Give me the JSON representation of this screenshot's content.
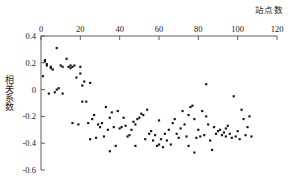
{
  "chart_data": {
    "type": "scatter",
    "title": "",
    "xlabel": "站点数",
    "ylabel": "相关系数",
    "xlim": [
      0,
      120
    ],
    "ylim": [
      -0.6,
      0.4
    ],
    "x_axis_position": "top",
    "y_axis_position": "left",
    "grid": false,
    "legend": null,
    "marker": "square",
    "marker_color": "#1a1a1a",
    "marker_size_px": 2.2,
    "xticks": [
      0,
      20,
      40,
      60,
      80,
      100,
      120
    ],
    "xticklabels": [
      "0",
      "20",
      "40",
      "60",
      "80",
      "100",
      "120"
    ],
    "yticks": [
      0.4,
      0.2,
      0,
      -0.2,
      -0.4,
      -0.6
    ],
    "yticklabels": [
      "0.4",
      "0.2",
      "0",
      "-0.2",
      "-0.4",
      "-0.6"
    ],
    "series": [
      {
        "name": "correlation",
        "points": [
          [
            1,
            0.1
          ],
          [
            2,
            0.22
          ],
          [
            2,
            0.21
          ],
          [
            3,
            0.19
          ],
          [
            3,
            0.18
          ],
          [
            4,
            -0.03
          ],
          [
            5,
            0.17
          ],
          [
            5,
            0.16
          ],
          [
            6,
            0.15
          ],
          [
            7,
            -0.02
          ],
          [
            8,
            0.31
          ],
          [
            8,
            0.0
          ],
          [
            9,
            0.01
          ],
          [
            10,
            0.18
          ],
          [
            11,
            0.17
          ],
          [
            11,
            -0.03
          ],
          [
            13,
            0.23
          ],
          [
            14,
            0.17
          ],
          [
            15,
            0.18
          ],
          [
            15,
            0.16
          ],
          [
            16,
            0.17
          ],
          [
            16,
            -0.25
          ],
          [
            17,
            0.18
          ],
          [
            18,
            0.09
          ],
          [
            19,
            -0.26
          ],
          [
            20,
            0.17
          ],
          [
            20,
            0.12
          ],
          [
            21,
            0.03
          ],
          [
            21,
            -0.09
          ],
          [
            22,
            0.06
          ],
          [
            23,
            -0.09
          ],
          [
            24,
            -0.25
          ],
          [
            25,
            0.05
          ],
          [
            25,
            -0.37
          ],
          [
            26,
            -0.22
          ],
          [
            27,
            -0.19
          ],
          [
            28,
            -0.36
          ],
          [
            29,
            -0.26
          ],
          [
            30,
            -0.28
          ],
          [
            31,
            -0.25
          ],
          [
            32,
            -0.35
          ],
          [
            33,
            -0.13
          ],
          [
            34,
            -0.3
          ],
          [
            35,
            -0.21
          ],
          [
            35,
            -0.46
          ],
          [
            36,
            -0.17
          ],
          [
            37,
            -0.28
          ],
          [
            38,
            -0.42
          ],
          [
            39,
            -0.16
          ],
          [
            40,
            -0.29
          ],
          [
            41,
            -0.28
          ],
          [
            42,
            -0.21
          ],
          [
            43,
            -0.27
          ],
          [
            44,
            -0.35
          ],
          [
            45,
            -0.34
          ],
          [
            46,
            -0.3
          ],
          [
            47,
            -0.24
          ],
          [
            48,
            -0.26
          ],
          [
            48,
            -0.42
          ],
          [
            49,
            -0.22
          ],
          [
            50,
            -0.21
          ],
          [
            51,
            -0.18
          ],
          [
            52,
            -0.19
          ],
          [
            53,
            -0.37
          ],
          [
            54,
            -0.15
          ],
          [
            55,
            -0.33
          ],
          [
            56,
            -0.31
          ],
          [
            57,
            -0.38
          ],
          [
            58,
            -0.34
          ],
          [
            59,
            -0.42
          ],
          [
            60,
            -0.23
          ],
          [
            60,
            -0.41
          ],
          [
            61,
            -0.37
          ],
          [
            62,
            -0.43
          ],
          [
            63,
            -0.33
          ],
          [
            64,
            -0.38
          ],
          [
            65,
            -0.3
          ],
          [
            66,
            -0.41
          ],
          [
            67,
            -0.25
          ],
          [
            68,
            -0.22
          ],
          [
            69,
            -0.33
          ],
          [
            70,
            -0.36
          ],
          [
            71,
            -0.29
          ],
          [
            72,
            -0.16
          ],
          [
            73,
            -0.26
          ],
          [
            74,
            -0.35
          ],
          [
            75,
            -0.19
          ],
          [
            75,
            -0.42
          ],
          [
            76,
            -0.13
          ],
          [
            77,
            -0.12
          ],
          [
            78,
            -0.22
          ],
          [
            78,
            -0.47
          ],
          [
            79,
            -0.36
          ],
          [
            80,
            -0.3
          ],
          [
            81,
            -0.35
          ],
          [
            82,
            -0.16
          ],
          [
            83,
            -0.34
          ],
          [
            84,
            0.04
          ],
          [
            84,
            -0.2
          ],
          [
            85,
            -0.26
          ],
          [
            86,
            -0.38
          ],
          [
            87,
            -0.45
          ],
          [
            88,
            -0.28
          ],
          [
            89,
            -0.33
          ],
          [
            90,
            -0.31
          ],
          [
            91,
            -0.3
          ],
          [
            92,
            -0.34
          ],
          [
            93,
            -0.32
          ],
          [
            94,
            -0.29
          ],
          [
            94,
            -0.35
          ],
          [
            95,
            -0.27
          ],
          [
            96,
            -0.33
          ],
          [
            97,
            -0.36
          ],
          [
            98,
            -0.05
          ],
          [
            99,
            -0.35
          ],
          [
            100,
            -0.31
          ],
          [
            101,
            -0.37
          ],
          [
            102,
            -0.15
          ],
          [
            103,
            -0.22
          ],
          [
            104,
            -0.34
          ],
          [
            105,
            -0.28
          ],
          [
            106,
            -0.2
          ],
          [
            107,
            -0.35
          ]
        ]
      }
    ]
  },
  "axes": {
    "top_axis_label": "站点数",
    "left_axis_label": "相关系数"
  }
}
